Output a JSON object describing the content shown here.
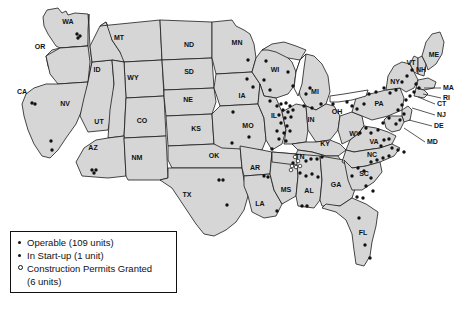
{
  "map": {
    "title": "US nuclear power plant locations by state",
    "fill_color": "#d6d6d6",
    "border_color": "#1a1a1a",
    "state_labels": [
      {
        "id": "WA",
        "label": "WA",
        "x": 68,
        "y": 22
      },
      {
        "id": "OR",
        "label": "OR",
        "x": 40,
        "y": 47
      },
      {
        "id": "CA",
        "label": "CA",
        "x": 22,
        "y": 92
      },
      {
        "id": "NV",
        "label": "NV",
        "x": 65,
        "y": 104
      },
      {
        "id": "ID",
        "label": "ID",
        "x": 97,
        "y": 70
      },
      {
        "id": "MT",
        "label": "MT",
        "x": 119,
        "y": 38
      },
      {
        "id": "WY",
        "label": "WY",
        "x": 133,
        "y": 78
      },
      {
        "id": "UT",
        "label": "UT",
        "x": 99,
        "y": 122
      },
      {
        "id": "AZ",
        "label": "AZ",
        "x": 93,
        "y": 148
      },
      {
        "id": "CO",
        "label": "CO",
        "x": 142,
        "y": 121
      },
      {
        "id": "NM",
        "label": "NM",
        "x": 137,
        "y": 158
      },
      {
        "id": "ND",
        "label": "ND",
        "x": 189,
        "y": 45
      },
      {
        "id": "SD",
        "label": "SD",
        "x": 189,
        "y": 72
      },
      {
        "id": "NE",
        "label": "NE",
        "x": 188,
        "y": 100
      },
      {
        "id": "KS",
        "label": "KS",
        "x": 196,
        "y": 129
      },
      {
        "id": "OK",
        "label": "OK",
        "x": 214,
        "y": 156
      },
      {
        "id": "TX",
        "label": "TX",
        "x": 187,
        "y": 195
      },
      {
        "id": "MN",
        "label": "MN",
        "x": 237,
        "y": 43
      },
      {
        "id": "IA",
        "label": "IA",
        "x": 242,
        "y": 96
      },
      {
        "id": "MO",
        "label": "MO",
        "x": 248,
        "y": 126
      },
      {
        "id": "AR",
        "label": "AR",
        "x": 255,
        "y": 168
      },
      {
        "id": "LA",
        "label": "LA",
        "x": 260,
        "y": 204
      },
      {
        "id": "WI",
        "label": "WI",
        "x": 275,
        "y": 70
      },
      {
        "id": "IL",
        "label": "IL",
        "x": 274,
        "y": 116
      },
      {
        "id": "MS",
        "label": "MS",
        "x": 286,
        "y": 190
      },
      {
        "id": "MI",
        "label": "MI",
        "x": 315,
        "y": 92
      },
      {
        "id": "IN",
        "label": "IN",
        "x": 311,
        "y": 120
      },
      {
        "id": "KY",
        "label": "KY",
        "x": 325,
        "y": 144
      },
      {
        "id": "TN",
        "label": "TN",
        "x": 300,
        "y": 157
      },
      {
        "id": "AL",
        "label": "AL",
        "x": 309,
        "y": 191
      },
      {
        "id": "GA",
        "label": "GA",
        "x": 336,
        "y": 185
      },
      {
        "id": "FL",
        "label": "FL",
        "x": 363,
        "y": 233
      },
      {
        "id": "OH",
        "label": "OH",
        "x": 337,
        "y": 112
      },
      {
        "id": "WV",
        "label": "WV",
        "x": 355,
        "y": 134
      },
      {
        "id": "VA",
        "label": "VA",
        "x": 374,
        "y": 142
      },
      {
        "id": "NC",
        "label": "NC",
        "x": 372,
        "y": 155
      },
      {
        "id": "SC",
        "label": "SC",
        "x": 364,
        "y": 174
      },
      {
        "id": "PA",
        "label": "PA",
        "x": 379,
        "y": 104
      },
      {
        "id": "NY",
        "label": "NY",
        "x": 395,
        "y": 82
      },
      {
        "id": "VT",
        "label": "VT",
        "x": 411,
        "y": 63
      },
      {
        "id": "NH",
        "label": "NH",
        "x": 421,
        "y": 70
      },
      {
        "id": "ME",
        "label": "ME",
        "x": 434,
        "y": 55
      }
    ],
    "callout_labels": [
      {
        "id": "MA",
        "label": "MA",
        "lx": 443,
        "ly": 88,
        "px": 424,
        "py": 88
      },
      {
        "id": "RI",
        "label": "RI",
        "lx": 443,
        "ly": 98,
        "px": 423,
        "py": 94
      },
      {
        "id": "CT",
        "label": "CT",
        "lx": 437,
        "ly": 104,
        "px": 418,
        "py": 97
      },
      {
        "id": "NJ",
        "label": "NJ",
        "lx": 437,
        "ly": 115,
        "px": 412,
        "py": 108
      },
      {
        "id": "DE",
        "label": "DE",
        "lx": 434,
        "ly": 126,
        "px": 409,
        "py": 120
      },
      {
        "id": "MD",
        "label": "MD",
        "lx": 427,
        "ly": 142,
        "px": 404,
        "py": 128
      }
    ]
  },
  "legend": {
    "items": [
      {
        "marker": "filled-dot",
        "label": "Operable (109 units)"
      },
      {
        "marker": "filled-dot",
        "label": "In Start-up (1 unit)"
      },
      {
        "marker": "open-circle",
        "label": "Construction Permits Granted"
      }
    ],
    "continuation": "(6 units)"
  },
  "chart_data": {
    "type": "map",
    "marker_types": [
      {
        "name": "Operable",
        "count": 109,
        "style": "filled-dot"
      },
      {
        "name": "In Start-up",
        "count": 1,
        "style": "filled-dot"
      },
      {
        "name": "Construction Permits Granted",
        "count": 6,
        "style": "open-circle"
      }
    ],
    "sites": [
      {
        "x": 77,
        "y": 34,
        "type": "operable"
      },
      {
        "x": 80,
        "y": 36,
        "type": "operable"
      },
      {
        "x": 78,
        "y": 38,
        "type": "operable"
      },
      {
        "x": 32,
        "y": 103,
        "type": "operable"
      },
      {
        "x": 35,
        "y": 104,
        "type": "operable"
      },
      {
        "x": 51,
        "y": 141,
        "type": "operable"
      },
      {
        "x": 52,
        "y": 150,
        "type": "operable"
      },
      {
        "x": 92,
        "y": 170,
        "type": "operable"
      },
      {
        "x": 96,
        "y": 170,
        "type": "operable"
      },
      {
        "x": 94,
        "y": 173,
        "type": "operable"
      },
      {
        "x": 233,
        "y": 112,
        "type": "operable"
      },
      {
        "x": 247,
        "y": 79,
        "type": "operable"
      },
      {
        "x": 253,
        "y": 87,
        "type": "operable"
      },
      {
        "x": 248,
        "y": 60,
        "type": "operable"
      },
      {
        "x": 266,
        "y": 61,
        "type": "operable"
      },
      {
        "x": 264,
        "y": 80,
        "type": "operable"
      },
      {
        "x": 270,
        "y": 90,
        "type": "operable"
      },
      {
        "x": 288,
        "y": 72,
        "type": "operable"
      },
      {
        "x": 293,
        "y": 86,
        "type": "operable"
      },
      {
        "x": 270,
        "y": 101,
        "type": "operable"
      },
      {
        "x": 277,
        "y": 106,
        "type": "operable"
      },
      {
        "x": 281,
        "y": 104,
        "type": "operable"
      },
      {
        "x": 286,
        "y": 103,
        "type": "operable"
      },
      {
        "x": 290,
        "y": 106,
        "type": "operable"
      },
      {
        "x": 283,
        "y": 110,
        "type": "operable"
      },
      {
        "x": 288,
        "y": 112,
        "type": "operable"
      },
      {
        "x": 293,
        "y": 110,
        "type": "operable"
      },
      {
        "x": 279,
        "y": 115,
        "type": "operable"
      },
      {
        "x": 285,
        "y": 118,
        "type": "operable"
      },
      {
        "x": 291,
        "y": 117,
        "type": "operable"
      },
      {
        "x": 281,
        "y": 123,
        "type": "operable"
      },
      {
        "x": 287,
        "y": 126,
        "type": "operable"
      },
      {
        "x": 277,
        "y": 131,
        "type": "operable"
      },
      {
        "x": 284,
        "y": 133,
        "type": "operable"
      },
      {
        "x": 290,
        "y": 131,
        "type": "operable"
      },
      {
        "x": 279,
        "y": 139,
        "type": "operable"
      },
      {
        "x": 286,
        "y": 141,
        "type": "operable"
      },
      {
        "x": 249,
        "y": 137,
        "type": "operable"
      },
      {
        "x": 232,
        "y": 143,
        "type": "operable"
      },
      {
        "x": 272,
        "y": 149,
        "type": "operable"
      },
      {
        "x": 264,
        "y": 176,
        "type": "operable"
      },
      {
        "x": 268,
        "y": 177,
        "type": "operable"
      },
      {
        "x": 277,
        "y": 211,
        "type": "operable"
      },
      {
        "x": 219,
        "y": 180,
        "type": "operable"
      },
      {
        "x": 223,
        "y": 180,
        "type": "operable"
      },
      {
        "x": 227,
        "y": 205,
        "type": "operable"
      },
      {
        "x": 306,
        "y": 94,
        "type": "operable"
      },
      {
        "x": 310,
        "y": 88,
        "type": "operable"
      },
      {
        "x": 304,
        "y": 106,
        "type": "operable"
      },
      {
        "x": 312,
        "y": 108,
        "type": "operable"
      },
      {
        "x": 321,
        "y": 104,
        "type": "operable"
      },
      {
        "x": 333,
        "y": 104,
        "type": "operable"
      },
      {
        "x": 347,
        "y": 102,
        "type": "operable"
      },
      {
        "x": 352,
        "y": 106,
        "type": "operable"
      },
      {
        "x": 357,
        "y": 109,
        "type": "operable"
      },
      {
        "x": 364,
        "y": 104,
        "type": "operable"
      },
      {
        "x": 369,
        "y": 94,
        "type": "operable"
      },
      {
        "x": 376,
        "y": 92,
        "type": "operable"
      },
      {
        "x": 384,
        "y": 88,
        "type": "operable"
      },
      {
        "x": 390,
        "y": 93,
        "type": "operable"
      },
      {
        "x": 396,
        "y": 90,
        "type": "operable"
      },
      {
        "x": 402,
        "y": 82,
        "type": "operable"
      },
      {
        "x": 407,
        "y": 76,
        "type": "operable"
      },
      {
        "x": 412,
        "y": 70,
        "type": "operable"
      },
      {
        "x": 416,
        "y": 84,
        "type": "operable"
      },
      {
        "x": 419,
        "y": 88,
        "type": "operable"
      },
      {
        "x": 414,
        "y": 92,
        "type": "operable"
      },
      {
        "x": 410,
        "y": 96,
        "type": "operable"
      },
      {
        "x": 406,
        "y": 100,
        "type": "operable"
      },
      {
        "x": 402,
        "y": 105,
        "type": "operable"
      },
      {
        "x": 398,
        "y": 110,
        "type": "operable"
      },
      {
        "x": 404,
        "y": 114,
        "type": "operable"
      },
      {
        "x": 400,
        "y": 120,
        "type": "operable"
      },
      {
        "x": 396,
        "y": 124,
        "type": "operable"
      },
      {
        "x": 389,
        "y": 118,
        "type": "operable"
      },
      {
        "x": 383,
        "y": 123,
        "type": "operable"
      },
      {
        "x": 378,
        "y": 130,
        "type": "operable"
      },
      {
        "x": 371,
        "y": 133,
        "type": "operable"
      },
      {
        "x": 366,
        "y": 128,
        "type": "operable"
      },
      {
        "x": 360,
        "y": 133,
        "type": "operable"
      },
      {
        "x": 384,
        "y": 140,
        "type": "operable"
      },
      {
        "x": 389,
        "y": 139,
        "type": "operable"
      },
      {
        "x": 381,
        "y": 146,
        "type": "operable"
      },
      {
        "x": 392,
        "y": 148,
        "type": "operable"
      },
      {
        "x": 398,
        "y": 150,
        "type": "operable"
      },
      {
        "x": 404,
        "y": 152,
        "type": "operable"
      },
      {
        "x": 371,
        "y": 162,
        "type": "operable"
      },
      {
        "x": 377,
        "y": 160,
        "type": "operable"
      },
      {
        "x": 383,
        "y": 158,
        "type": "operable"
      },
      {
        "x": 389,
        "y": 156,
        "type": "operable"
      },
      {
        "x": 358,
        "y": 168,
        "type": "operable"
      },
      {
        "x": 364,
        "y": 171,
        "type": "operable"
      },
      {
        "x": 352,
        "y": 176,
        "type": "operable"
      },
      {
        "x": 371,
        "y": 178,
        "type": "operable"
      },
      {
        "x": 366,
        "y": 186,
        "type": "operable"
      },
      {
        "x": 373,
        "y": 191,
        "type": "operable"
      },
      {
        "x": 357,
        "y": 197,
        "type": "operable"
      },
      {
        "x": 363,
        "y": 198,
        "type": "operable"
      },
      {
        "x": 306,
        "y": 161,
        "type": "operable"
      },
      {
        "x": 311,
        "y": 159,
        "type": "operable"
      },
      {
        "x": 317,
        "y": 159,
        "type": "operable"
      },
      {
        "x": 322,
        "y": 157,
        "type": "operable"
      },
      {
        "x": 300,
        "y": 173,
        "type": "operable"
      },
      {
        "x": 306,
        "y": 176,
        "type": "operable"
      },
      {
        "x": 312,
        "y": 174,
        "type": "operable"
      },
      {
        "x": 318,
        "y": 177,
        "type": "operable"
      },
      {
        "x": 302,
        "y": 206,
        "type": "operable"
      },
      {
        "x": 307,
        "y": 206,
        "type": "operable"
      },
      {
        "x": 359,
        "y": 218,
        "type": "operable"
      },
      {
        "x": 365,
        "y": 245,
        "type": "operable"
      },
      {
        "x": 370,
        "y": 258,
        "type": "operable"
      },
      {
        "x": 293,
        "y": 163,
        "type": "startup"
      },
      {
        "x": 295,
        "y": 157,
        "type": "permit"
      },
      {
        "x": 298,
        "y": 161,
        "type": "permit"
      },
      {
        "x": 292,
        "y": 166,
        "type": "permit"
      },
      {
        "x": 296,
        "y": 167,
        "type": "permit"
      },
      {
        "x": 300,
        "y": 166,
        "type": "permit"
      },
      {
        "x": 291,
        "y": 170,
        "type": "permit"
      }
    ]
  }
}
